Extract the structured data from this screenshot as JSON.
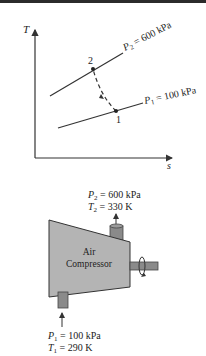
{
  "ts_diagram": {
    "y_axis_label": "T",
    "x_axis_label": "s",
    "line_high_label": "P",
    "line_high_sub": "2",
    "line_high_value": " = 600 kPa",
    "line_low_label": "P",
    "line_low_sub": "1",
    "line_low_value": " = 100 kPa",
    "point_1": "1",
    "point_2": "2"
  },
  "compressor": {
    "name_line1": "Air",
    "name_line2": "Compressor",
    "outlet_p_label": "P",
    "outlet_p_sub": "2",
    "outlet_p_value": " = 600 kPa",
    "outlet_t_label": "T",
    "outlet_t_sub": "2",
    "outlet_t_value": " = 330 K",
    "inlet_p_label": "P",
    "inlet_p_sub": "1",
    "inlet_p_value": " = 100 kPa",
    "inlet_t_label": "T",
    "inlet_t_sub": "1",
    "inlet_t_value": " = 290 K"
  },
  "colors": {
    "body_fill": "#b4b4b4",
    "pipe_fill": "#8a8a8a",
    "line": "#333333"
  }
}
